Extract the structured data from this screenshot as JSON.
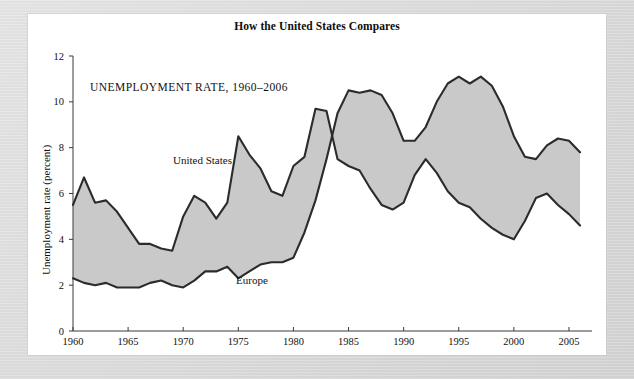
{
  "figure": {
    "title": "How the United States Compares",
    "caption": "UNEMPLOYMENT RATE, 1960–2006"
  },
  "chart_data": {
    "type": "line",
    "title": "How the United States Compares",
    "subtitle": "UNEMPLOYMENT RATE, 1960–2006",
    "xlabel": "",
    "ylabel": "Unemployment rate (percent)",
    "xlim": [
      1960,
      2006
    ],
    "ylim": [
      0,
      12
    ],
    "yticks": [
      0,
      2,
      4,
      6,
      8,
      10,
      12
    ],
    "ytick_labels": [
      "0",
      "2",
      "4",
      "6",
      "8",
      "10",
      "12"
    ],
    "xticks": [
      1960,
      1965,
      1970,
      1975,
      1980,
      1985,
      1990,
      1995,
      2000,
      2005
    ],
    "xtick_labels": [
      "1960",
      "1965",
      "1970",
      "1975",
      "1980",
      "1985",
      "1990",
      "1995",
      "2000",
      "2005"
    ],
    "grid": false,
    "legend": "inline-annotations",
    "fill_between": true,
    "fill_color": "#c9c9c9",
    "line_color": "#2b2b2b",
    "x": [
      1960,
      1961,
      1962,
      1963,
      1964,
      1965,
      1966,
      1967,
      1968,
      1969,
      1970,
      1971,
      1972,
      1973,
      1974,
      1975,
      1976,
      1977,
      1978,
      1979,
      1980,
      1981,
      1982,
      1983,
      1984,
      1985,
      1986,
      1987,
      1988,
      1989,
      1990,
      1991,
      1992,
      1993,
      1994,
      1995,
      1996,
      1997,
      1998,
      1999,
      2000,
      2001,
      2002,
      2003,
      2004,
      2005,
      2006
    ],
    "series": [
      {
        "name": "United States",
        "label_position": "upper-left",
        "values": [
          5.5,
          6.7,
          5.6,
          5.7,
          5.2,
          4.5,
          3.8,
          3.8,
          3.6,
          3.5,
          5.0,
          5.9,
          5.6,
          4.9,
          5.6,
          8.5,
          7.7,
          7.1,
          6.1,
          5.9,
          7.2,
          7.6,
          9.7,
          9.6,
          7.5,
          7.2,
          7.0,
          6.2,
          5.5,
          5.3,
          5.6,
          6.8,
          7.5,
          6.9,
          6.1,
          5.6,
          5.4,
          4.9,
          4.5,
          4.2,
          4.0,
          4.8,
          5.8,
          6.0,
          5.5,
          5.1,
          4.6
        ]
      },
      {
        "name": "Europe",
        "label_position": "lower-middle",
        "values": [
          2.3,
          2.1,
          2.0,
          2.1,
          1.9,
          1.9,
          1.9,
          2.1,
          2.2,
          2.0,
          1.9,
          2.2,
          2.6,
          2.6,
          2.8,
          2.3,
          2.6,
          2.9,
          3.0,
          3.0,
          3.2,
          4.3,
          5.7,
          7.5,
          9.5,
          10.5,
          10.4,
          10.5,
          10.3,
          9.5,
          8.3,
          8.3,
          8.9,
          10.0,
          10.8,
          11.1,
          10.8,
          11.1,
          10.7,
          9.8,
          8.5,
          7.6,
          7.5,
          8.1,
          8.4,
          8.3,
          7.8
        ]
      }
    ]
  },
  "axis": {
    "y_title": "Unemployment rate (percent)"
  }
}
